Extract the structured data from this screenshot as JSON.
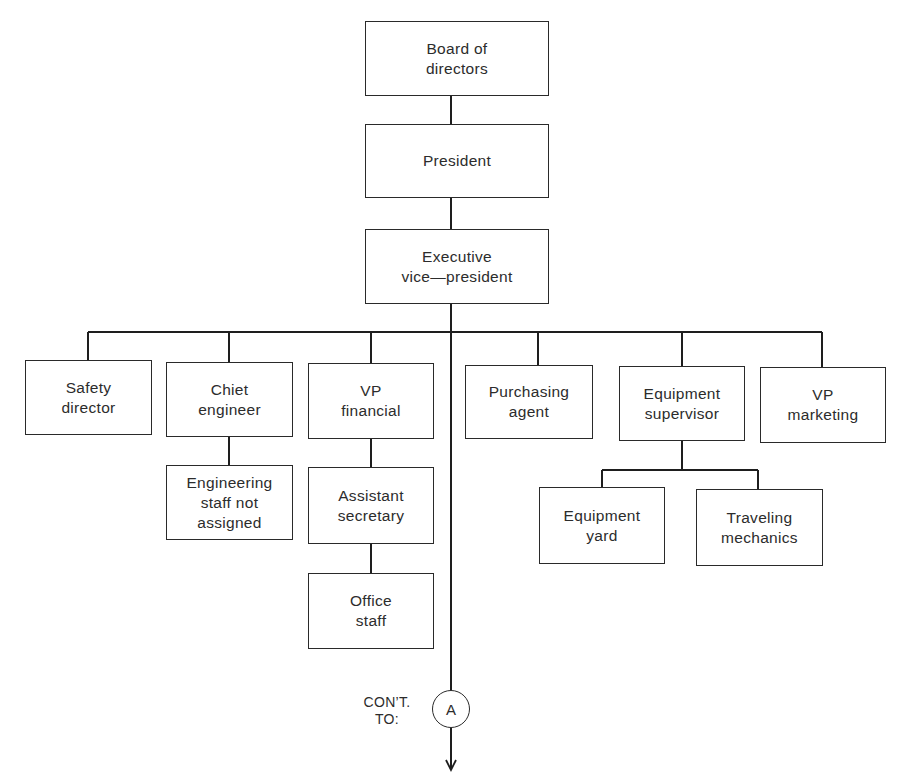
{
  "chart": {
    "type": "org-chart",
    "nodes": {
      "board": "Board of\ndirectors",
      "president": "President",
      "evp": "Executive\nvice—president",
      "safety": "Safety\ndirector",
      "chief_engineer": "Chiet\nengineer",
      "engineering_staff": "Engineering\nstaff not\nassigned",
      "vp_financial": "VP\nfinancial",
      "assistant_secretary": "Assistant\nsecretary",
      "office_staff": "Office\nstaff",
      "purchasing": "Purchasing\nagent",
      "equipment_supervisor": "Equipment\nsupervisor",
      "equipment_yard": "Equipment\nyard",
      "traveling_mechanics": "Traveling\nmechanics",
      "vp_marketing": "VP\nmarketing"
    },
    "continuation": {
      "label": "CON’T.\nTO:",
      "connector": "A"
    },
    "hierarchy": [
      {
        "parent": "board",
        "children": [
          "president"
        ]
      },
      {
        "parent": "president",
        "children": [
          "evp"
        ]
      },
      {
        "parent": "evp",
        "children": [
          "safety",
          "chief_engineer",
          "vp_financial",
          "purchasing",
          "equipment_supervisor",
          "vp_marketing",
          "continuation-A"
        ]
      },
      {
        "parent": "chief_engineer",
        "children": [
          "engineering_staff"
        ]
      },
      {
        "parent": "vp_financial",
        "children": [
          "assistant_secretary"
        ]
      },
      {
        "parent": "assistant_secretary",
        "children": [
          "office_staff"
        ]
      },
      {
        "parent": "equipment_supervisor",
        "children": [
          "equipment_yard",
          "traveling_mechanics"
        ]
      }
    ]
  }
}
